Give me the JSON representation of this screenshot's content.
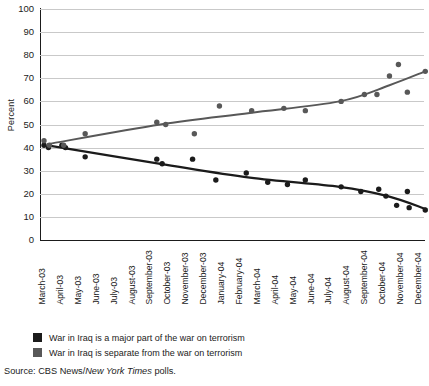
{
  "chart_data": {
    "type": "scatter",
    "title": "",
    "xlabel": "",
    "ylabel": "Percent",
    "ylim": [
      0,
      100
    ],
    "yticks": [
      100,
      90,
      80,
      70,
      60,
      50,
      40,
      30,
      20,
      10,
      0
    ],
    "grid": true,
    "legend_position": "below-plot",
    "categories": [
      "March-03",
      "April-03",
      "May-03",
      "June-03",
      "July-03",
      "August-03",
      "September-03",
      "October-03",
      "November-03",
      "December-03",
      "January-04",
      "February-04",
      "March-04",
      "April-04",
      "May-04",
      "June-04",
      "July-04",
      "August-04",
      "September-04",
      "October-04",
      "November-04",
      "December-04"
    ],
    "series": [
      {
        "name": "War in Iraq is a major part of the war on terrorism",
        "color": "#1b1b1b",
        "points": [
          {
            "x": "March-03",
            "xi": 0,
            "y": 41
          },
          {
            "x": "March-03",
            "xi": 0.25,
            "y": 40
          },
          {
            "x": "April-03",
            "xi": 1,
            "y": 41
          },
          {
            "x": "April-03",
            "xi": 1.2,
            "y": 40
          },
          {
            "x": "May-03",
            "xi": 2.3,
            "y": 36
          },
          {
            "x": "September-03",
            "xi": 6.3,
            "y": 35
          },
          {
            "x": "September-03",
            "xi": 6.6,
            "y": 33
          },
          {
            "x": "November-03",
            "xi": 8.3,
            "y": 35
          },
          {
            "x": "December-03",
            "xi": 9.6,
            "y": 26
          },
          {
            "x": "February-04",
            "xi": 11.3,
            "y": 29
          },
          {
            "x": "March-04",
            "xi": 12.5,
            "y": 25
          },
          {
            "x": "April-04",
            "xi": 13.6,
            "y": 24
          },
          {
            "x": "May-04",
            "xi": 14.6,
            "y": 26
          },
          {
            "x": "July-04",
            "xi": 16.6,
            "y": 23
          },
          {
            "x": "August-04",
            "xi": 17.7,
            "y": 21
          },
          {
            "x": "September-04",
            "xi": 18.7,
            "y": 22
          },
          {
            "x": "September-04",
            "xi": 19.1,
            "y": 19
          },
          {
            "x": "October-04",
            "xi": 19.7,
            "y": 15
          },
          {
            "x": "November-04",
            "xi": 20.3,
            "y": 21
          },
          {
            "x": "November-04",
            "xi": 20.4,
            "y": 14
          },
          {
            "x": "December-04",
            "xi": 21.3,
            "y": 13
          }
        ],
        "trend": [
          {
            "xi": 0.2,
            "y": 41
          },
          {
            "xi": 6.5,
            "y": 33
          },
          {
            "xi": 11.5,
            "y": 27
          },
          {
            "xi": 16.5,
            "y": 23
          },
          {
            "xi": 19.2,
            "y": 19
          },
          {
            "xi": 21.3,
            "y": 13.5
          }
        ]
      },
      {
        "name": "War in Iraq is separate from the war on terrorism",
        "color": "#585858",
        "points": [
          {
            "x": "March-03",
            "xi": 0,
            "y": 43
          },
          {
            "x": "March-03",
            "xi": 0.3,
            "y": 41
          },
          {
            "x": "April-03",
            "xi": 1.1,
            "y": 41
          },
          {
            "x": "May-03",
            "xi": 2.3,
            "y": 46
          },
          {
            "x": "September-03",
            "xi": 6.3,
            "y": 51
          },
          {
            "x": "September-03",
            "xi": 6.8,
            "y": 50
          },
          {
            "x": "November-03",
            "xi": 8.4,
            "y": 46
          },
          {
            "x": "December-03",
            "xi": 9.8,
            "y": 58
          },
          {
            "x": "February-04",
            "xi": 11.6,
            "y": 56
          },
          {
            "x": "April-04",
            "xi": 13.4,
            "y": 57
          },
          {
            "x": "May-04",
            "xi": 14.6,
            "y": 56
          },
          {
            "x": "July-04",
            "xi": 16.6,
            "y": 60
          },
          {
            "x": "August-04",
            "xi": 17.9,
            "y": 63
          },
          {
            "x": "September-04",
            "xi": 18.6,
            "y": 63
          },
          {
            "x": "September-04",
            "xi": 19.3,
            "y": 71
          },
          {
            "x": "October-04",
            "xi": 19.8,
            "y": 76
          },
          {
            "x": "November-04",
            "xi": 20.3,
            "y": 64
          },
          {
            "x": "December-04",
            "xi": 21.3,
            "y": 73
          }
        ],
        "trend": [
          {
            "xi": 0.2,
            "y": 41.5
          },
          {
            "xi": 6.5,
            "y": 50
          },
          {
            "xi": 11.5,
            "y": 55
          },
          {
            "xi": 16.5,
            "y": 60
          },
          {
            "xi": 19.3,
            "y": 67
          },
          {
            "xi": 21.3,
            "y": 73
          }
        ]
      }
    ]
  },
  "legend": {
    "items": [
      {
        "label": "War in Iraq is a major part of the war on terrorism",
        "color": "#1b1b1b"
      },
      {
        "label": "War in Iraq is separate from the war on terrorism",
        "color": "#585858"
      }
    ]
  },
  "source": {
    "prefix": "Source: CBS News/",
    "italic": "New York Times",
    "suffix": " polls."
  }
}
